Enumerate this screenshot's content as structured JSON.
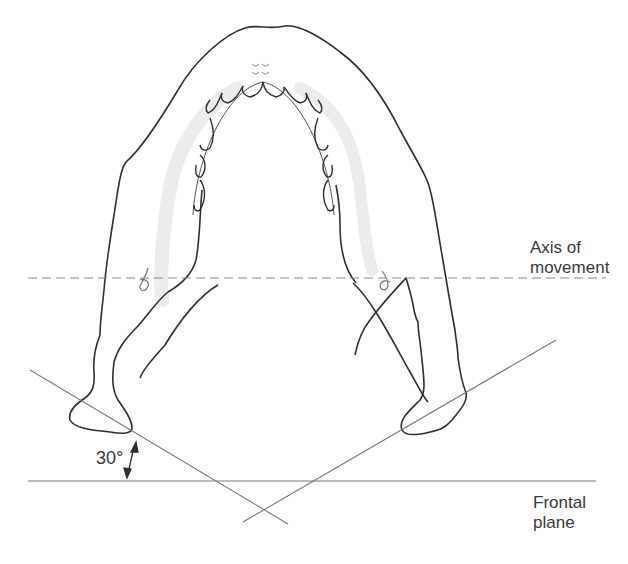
{
  "figure": {
    "labels": {
      "axis_line1": "Axis of",
      "axis_line2": "movement",
      "frontal_line1": "Frontal",
      "frontal_line2": "plane",
      "angle": "30°"
    },
    "colors": {
      "outline": "#2f2f2f",
      "guide_lines": "#7a7a7a",
      "dashed_axis": "#8a8a8a",
      "shading": "#ececec",
      "text": "#3a3a3a"
    },
    "lines": {
      "axis_of_movement": {
        "style": "dashed",
        "y": 278,
        "x1": 28,
        "x2": 606
      },
      "frontal_plane": {
        "style": "solid",
        "y": 481,
        "x1": 28,
        "x2": 596
      },
      "left_condyle_axis": {
        "x1": 30,
        "y1": 370,
        "x2": 288,
        "y2": 524
      },
      "right_condyle_axis": {
        "x1": 243,
        "y1": 522,
        "x2": 556,
        "y2": 340
      }
    },
    "angle_between_condyle_axis_and_frontal_plane_deg": 30
  }
}
